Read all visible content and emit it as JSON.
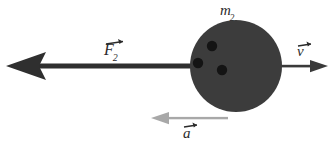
{
  "figure": {
    "type": "physics-free-body-diagram",
    "background_color": "#ffffff",
    "width": 332,
    "height": 153
  },
  "labels": {
    "mass": {
      "symbol": "m",
      "subscript": "2",
      "vector": false
    },
    "force": {
      "symbol": "F",
      "subscript": "2",
      "vector": true
    },
    "velocity": {
      "symbol": "v",
      "subscript": "",
      "vector": true
    },
    "acceleration": {
      "symbol": "a",
      "subscript": "",
      "vector": true
    }
  },
  "body": {
    "name": "mass-m2",
    "shape": "circle",
    "center_x": 236,
    "center_y": 66,
    "radius": 46,
    "fill": "#3c3c3c",
    "dots": [
      {
        "cx": 212,
        "cy": 46,
        "r": 5,
        "fill": "#141414"
      },
      {
        "cx": 198,
        "cy": 63,
        "r": 5,
        "fill": "#141414"
      },
      {
        "cx": 222,
        "cy": 70,
        "r": 5,
        "fill": "#141414"
      }
    ]
  },
  "vectors": [
    {
      "name": "force-arrow-F2",
      "label": "F2",
      "direction": "left",
      "from_x": 196,
      "to_x": 8,
      "y": 66,
      "thickness": 5,
      "color": "#2f2f2f",
      "head_style": "swept-back"
    },
    {
      "name": "velocity-arrow-v",
      "label": "v",
      "direction": "right",
      "from_x": 278,
      "to_x": 326,
      "y": 66,
      "thickness": 3,
      "color": "#3a3a3a",
      "head_style": "triangle"
    },
    {
      "name": "acceleration-arrow-a",
      "label": "a",
      "direction": "left",
      "from_x": 228,
      "to_x": 152,
      "y": 118,
      "thickness": 3,
      "color": "#a8a8a8",
      "head_style": "triangle"
    }
  ],
  "colors": {
    "body_fill": "#3c3c3c",
    "dot_fill": "#141414",
    "force_arrow": "#2f2f2f",
    "velocity_arrow": "#3a3a3a",
    "acceleration_arrow": "#a8a8a8",
    "text": "#2b2b2b"
  }
}
